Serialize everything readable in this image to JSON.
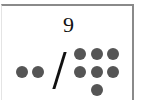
{
  "card": {
    "number": "9",
    "separator": "/",
    "left_group": {
      "count": 2,
      "dots": [
        {
          "x": 15,
          "y": 60
        },
        {
          "x": 31,
          "y": 60
        }
      ]
    },
    "right_group": {
      "count": 7,
      "dots": [
        {
          "x": 73,
          "y": 42
        },
        {
          "x": 89,
          "y": 42
        },
        {
          "x": 105,
          "y": 42
        },
        {
          "x": 73,
          "y": 60
        },
        {
          "x": 89,
          "y": 60
        },
        {
          "x": 105,
          "y": 60
        },
        {
          "x": 89,
          "y": 77
        }
      ]
    },
    "colors": {
      "dot": "#555555",
      "text": "#111111",
      "border": "#8a8a8a"
    }
  }
}
